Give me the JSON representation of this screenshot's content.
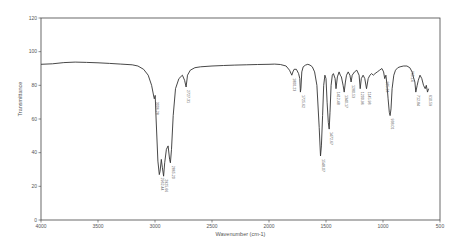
{
  "chart_data": {
    "type": "line",
    "title": "",
    "xlabel": "Wavenumber (cm-1)",
    "ylabel": "Transmittance",
    "xlim": [
      4000,
      500
    ],
    "ylim": [
      0,
      120
    ],
    "x_ticks": [
      4000,
      3500,
      3000,
      2500,
      2000,
      1500,
      1000,
      500
    ],
    "y_ticks": [
      0,
      20,
      40,
      60,
      80,
      100,
      120
    ],
    "grid": false,
    "legend": null,
    "series": [
      {
        "name": "IR spectrum",
        "points": [
          [
            4000,
            92.5
          ],
          [
            3900,
            92.8
          ],
          [
            3800,
            93.5
          ],
          [
            3700,
            93.8
          ],
          [
            3600,
            93.6
          ],
          [
            3500,
            93.4
          ],
          [
            3400,
            93.0
          ],
          [
            3300,
            92.6
          ],
          [
            3200,
            92.2
          ],
          [
            3150,
            91.5
          ],
          [
            3100,
            89.5
          ],
          [
            3060,
            86
          ],
          [
            3030,
            80
          ],
          [
            3010,
            73
          ],
          [
            3006,
            72
          ],
          [
            2998,
            74
          ],
          [
            2990,
            60
          ],
          [
            2975,
            35
          ],
          [
            2962,
            27
          ],
          [
            2955,
            29
          ],
          [
            2945,
            36
          ],
          [
            2935,
            31
          ],
          [
            2925,
            26
          ],
          [
            2915,
            34
          ],
          [
            2900,
            42
          ],
          [
            2885,
            44
          ],
          [
            2872,
            36
          ],
          [
            2865,
            34
          ],
          [
            2855,
            42
          ],
          [
            2840,
            62
          ],
          [
            2820,
            78
          ],
          [
            2790,
            84
          ],
          [
            2760,
            86
          ],
          [
            2740,
            83
          ],
          [
            2727,
            79
          ],
          [
            2715,
            86
          ],
          [
            2690,
            89
          ],
          [
            2650,
            90.5
          ],
          [
            2600,
            91
          ],
          [
            2500,
            91.5
          ],
          [
            2400,
            91.8
          ],
          [
            2300,
            92
          ],
          [
            2200,
            92.2
          ],
          [
            2100,
            92.4
          ],
          [
            2000,
            92.5
          ],
          [
            1950,
            92.6
          ],
          [
            1900,
            92.4
          ],
          [
            1850,
            91.5
          ],
          [
            1820,
            89
          ],
          [
            1800,
            86
          ],
          [
            1790,
            88
          ],
          [
            1780,
            89.5
          ],
          [
            1760,
            89.5
          ],
          [
            1740,
            87
          ],
          [
            1730,
            84
          ],
          [
            1725,
            76
          ],
          [
            1720,
            78
          ],
          [
            1712,
            88
          ],
          [
            1700,
            91
          ],
          [
            1680,
            92
          ],
          [
            1660,
            92.5
          ],
          [
            1640,
            92
          ],
          [
            1620,
            91
          ],
          [
            1600,
            88
          ],
          [
            1580,
            80
          ],
          [
            1560,
            55
          ],
          [
            1548,
            38
          ],
          [
            1540,
            44
          ],
          [
            1530,
            62
          ],
          [
            1520,
            80
          ],
          [
            1510,
            86
          ],
          [
            1500,
            84
          ],
          [
            1490,
            70
          ],
          [
            1480,
            58
          ],
          [
            1472,
            54
          ],
          [
            1465,
            64
          ],
          [
            1455,
            80
          ],
          [
            1445,
            86
          ],
          [
            1435,
            87
          ],
          [
            1420,
            84
          ],
          [
            1412,
            78
          ],
          [
            1400,
            85
          ],
          [
            1385,
            88
          ],
          [
            1375,
            86
          ],
          [
            1365,
            85
          ],
          [
            1350,
            80
          ],
          [
            1340,
            76
          ],
          [
            1330,
            82
          ],
          [
            1320,
            86
          ],
          [
            1305,
            88
          ],
          [
            1290,
            86
          ],
          [
            1280,
            82
          ],
          [
            1270,
            86
          ],
          [
            1250,
            88
          ],
          [
            1230,
            89
          ],
          [
            1210,
            86
          ],
          [
            1200,
            78
          ],
          [
            1190,
            84
          ],
          [
            1175,
            86
          ],
          [
            1160,
            84
          ],
          [
            1145,
            78
          ],
          [
            1130,
            84
          ],
          [
            1115,
            86
          ],
          [
            1100,
            87
          ],
          [
            1085,
            86
          ],
          [
            1070,
            87
          ],
          [
            1050,
            88
          ],
          [
            1030,
            89
          ],
          [
            1010,
            90
          ],
          [
            995,
            88
          ],
          [
            985,
            84
          ],
          [
            975,
            86
          ],
          [
            965,
            80
          ],
          [
            955,
            72
          ],
          [
            945,
            64
          ],
          [
            938,
            62
          ],
          [
            930,
            66
          ],
          [
            920,
            78
          ],
          [
            905,
            86
          ],
          [
            890,
            89
          ],
          [
            870,
            90.5
          ],
          [
            850,
            91
          ],
          [
            820,
            91.5
          ],
          [
            790,
            91.5
          ],
          [
            765,
            90.5
          ],
          [
            745,
            88
          ],
          [
            730,
            84
          ],
          [
            720,
            82
          ],
          [
            712,
            76
          ],
          [
            700,
            80
          ],
          [
            690,
            83
          ],
          [
            675,
            86
          ],
          [
            660,
            84
          ],
          [
            645,
            80
          ],
          [
            630,
            78
          ],
          [
            620,
            80
          ],
          [
            610,
            76
          ],
          [
            600,
            78
          ]
        ],
        "color": "#333333"
      }
    ],
    "annotations": [
      {
        "x": 3006,
        "label": "3006.28"
      },
      {
        "x": 2962,
        "label": "2962.44"
      },
      {
        "x": 2925,
        "label": "2925.66"
      },
      {
        "x": 2865,
        "label": "2865.20"
      },
      {
        "x": 2727,
        "label": "2727.31"
      },
      {
        "x": 1800,
        "label": "1800.23"
      },
      {
        "x": 1725,
        "label": "1725.62"
      },
      {
        "x": 1548,
        "label": "1548.07"
      },
      {
        "x": 1472,
        "label": "1472.67"
      },
      {
        "x": 1412,
        "label": "1412.48"
      },
      {
        "x": 1340,
        "label": "1340.17"
      },
      {
        "x": 1280,
        "label": "1280.53"
      },
      {
        "x": 1200,
        "label": "1200.96"
      },
      {
        "x": 1145,
        "label": "1145.98"
      },
      {
        "x": 985,
        "label": "985.24"
      },
      {
        "x": 938,
        "label": "938.01"
      },
      {
        "x": 765,
        "label": "765.14"
      },
      {
        "x": 712,
        "label": "712.84"
      },
      {
        "x": 610,
        "label": "610.59"
      }
    ]
  }
}
